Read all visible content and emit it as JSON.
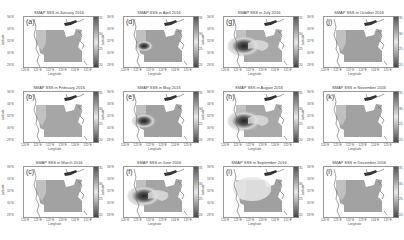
{
  "figure": {
    "colorbar": {
      "ticks": [
        "35",
        "30",
        "25",
        "20"
      ],
      "range": [
        20,
        36
      ],
      "colormap": "grayscale"
    },
    "axes": {
      "xlabel": "Longitude",
      "ylabel": "Latitude",
      "xticks": [
        "120°E",
        "121°E",
        "122°E",
        "123°E",
        "124°E",
        "125°E"
      ],
      "yticks": [
        "36°N",
        "34°N",
        "32°N",
        "30°N",
        "28°N"
      ]
    },
    "panels": [
      {
        "letter": "(a)",
        "title": "SMAP SSS in January 2016",
        "col": 0,
        "row": 0,
        "plume": "none",
        "tone": "#a4a4a4"
      },
      {
        "letter": "(b)",
        "title": "SMAP SSS in February 2016",
        "col": 0,
        "row": 1,
        "plume": "none",
        "tone": "#a6a6a6"
      },
      {
        "letter": "(c)",
        "title": "SMAP SSS in March 2016",
        "col": 0,
        "row": 2,
        "plume": "none",
        "tone": "#a2a2a2"
      },
      {
        "letter": "(d)",
        "title": "SMAP SSS in April 2016",
        "col": 1,
        "row": 0,
        "plume": "small",
        "tone": "#a0a0a0"
      },
      {
        "letter": "(e)",
        "title": "SMAP SSS in May 2016",
        "col": 1,
        "row": 1,
        "plume": "medium",
        "tone": "#a0a0a0"
      },
      {
        "letter": "(f)",
        "title": "SMAP SSS in June 2016",
        "col": 1,
        "row": 2,
        "plume": "large",
        "tone": "#a3a3a3"
      },
      {
        "letter": "(g)",
        "title": "SMAP SSS in July 2016",
        "col": 2,
        "row": 0,
        "plume": "large",
        "tone": "#a8a8a8"
      },
      {
        "letter": "(h)",
        "title": "SMAP SSS in August 2016",
        "col": 2,
        "row": 1,
        "plume": "large",
        "tone": "#a8a8a8"
      },
      {
        "letter": "(i)",
        "title": "SMAP SSS in September 2016",
        "col": 2,
        "row": 2,
        "plume": "light",
        "tone": "#a0a0a0"
      },
      {
        "letter": "(j)",
        "title": "SMAP SSS in October 2016",
        "col": 3,
        "row": 0,
        "plume": "none",
        "tone": "#a0a0a0"
      },
      {
        "letter": "(k)",
        "title": "SMAP SSS in November 2016",
        "col": 3,
        "row": 1,
        "plume": "none",
        "tone": "#a2a2a2"
      },
      {
        "letter": "(l)",
        "title": "SMAP SSS in December 2016",
        "col": 3,
        "row": 2,
        "plume": "none",
        "tone": "#a2a2a2"
      }
    ]
  },
  "chart_data": {
    "type": "heatmap",
    "layout": {
      "rows": 3,
      "cols": 4,
      "order": "column-major"
    },
    "xlabel": "Longitude",
    "ylabel": "Latitude",
    "xticks": [
      "120°E",
      "121°E",
      "122°E",
      "123°E",
      "124°E",
      "125°E"
    ],
    "yticks": [
      "36°N",
      "34°N",
      "32°N",
      "30°N",
      "28°N"
    ],
    "colorbar": {
      "ticks": [
        35,
        30,
        25,
        20
      ],
      "label": "SSS"
    },
    "panels": [
      {
        "label": "(a)",
        "title": "SMAP SSS in January 2016"
      },
      {
        "label": "(b)",
        "title": "SMAP SSS in February 2016"
      },
      {
        "label": "(c)",
        "title": "SMAP SSS in March 2016"
      },
      {
        "label": "(d)",
        "title": "SMAP SSS in April 2016"
      },
      {
        "label": "(e)",
        "title": "SMAP SSS in May 2016"
      },
      {
        "label": "(f)",
        "title": "SMAP SSS in June 2016"
      },
      {
        "label": "(g)",
        "title": "SMAP SSS in July 2016"
      },
      {
        "label": "(h)",
        "title": "SMAP SSS in August 2016"
      },
      {
        "label": "(i)",
        "title": "SMAP SSS in September 2016"
      },
      {
        "label": "(j)",
        "title": "SMAP SSS in October 2016"
      },
      {
        "label": "(k)",
        "title": "SMAP SSS in November 2016"
      },
      {
        "label": "(l)",
        "title": "SMAP SSS in December 2016"
      }
    ]
  }
}
